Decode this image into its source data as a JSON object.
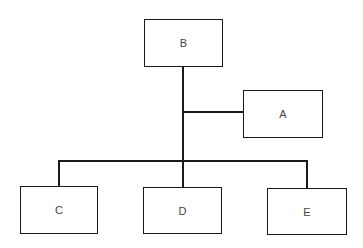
{
  "diagram": {
    "type": "org-chart",
    "nodes": [
      {
        "id": "B",
        "label": "B",
        "x": 144,
        "y": 19,
        "w": 79,
        "h": 48
      },
      {
        "id": "A",
        "label": "A",
        "x": 243,
        "y": 90,
        "w": 80,
        "h": 48
      },
      {
        "id": "C",
        "label": "C",
        "x": 20,
        "y": 186,
        "w": 78,
        "h": 48
      },
      {
        "id": "D",
        "label": "D",
        "x": 143,
        "y": 187,
        "w": 79,
        "h": 47
      },
      {
        "id": "E",
        "label": "E",
        "x": 267,
        "y": 188,
        "w": 80,
        "h": 47
      }
    ],
    "edges": [
      {
        "from": "B",
        "to": "A"
      },
      {
        "from": "B",
        "to": "C"
      },
      {
        "from": "B",
        "to": "D"
      },
      {
        "from": "B",
        "to": "E"
      }
    ]
  }
}
